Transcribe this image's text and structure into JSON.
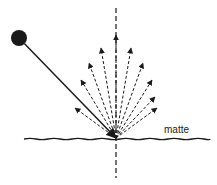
{
  "diagram": {
    "surface_label": "matte",
    "colors": {
      "ink": "#1a1a1a",
      "background": "#ffffff"
    },
    "light_source": {
      "shape": "filled-circle",
      "cx": 19,
      "cy": 38,
      "r": 8
    },
    "incident_ray": {
      "from": [
        19,
        38
      ],
      "to": [
        116,
        138
      ],
      "style": "solid"
    },
    "normal_line": {
      "x": 116,
      "y_top": 8,
      "y_bottom": 178,
      "style": "dashed"
    },
    "surface": {
      "y": 139,
      "x_start": 24,
      "x_end": 210,
      "style": "wavy"
    },
    "reflection_origin": [
      116,
      138
    ],
    "reflected_rays": [
      {
        "tip": [
          75,
          108
        ]
      },
      {
        "tip": [
          81,
          80
        ]
      },
      {
        "tip": [
          89,
          63
        ]
      },
      {
        "tip": [
          101,
          48
        ]
      },
      {
        "tip": [
          116,
          35
        ]
      },
      {
        "tip": [
          131,
          48
        ]
      },
      {
        "tip": [
          143,
          63
        ]
      },
      {
        "tip": [
          152,
          80
        ]
      },
      {
        "tip": [
          155,
          97
        ]
      },
      {
        "tip": [
          157,
          108
        ]
      }
    ]
  }
}
